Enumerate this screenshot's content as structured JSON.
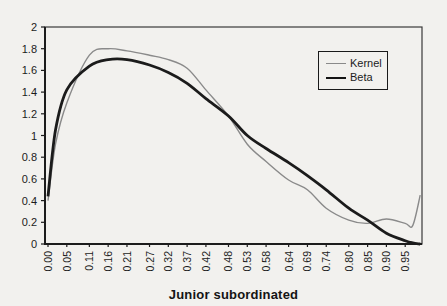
{
  "figure": {
    "background": "#f2f1ee"
  },
  "colors": {
    "kernel_line": "#8a8a8a",
    "beta_line": "#1b1b1b",
    "axis": "#1c1c1c",
    "frame": "#3a3a3a",
    "text": "#1c1c1c"
  },
  "chart_data": {
    "type": "line",
    "title": "",
    "xlabel": "Junior subordinated",
    "ylabel": "",
    "xlim": [
      0,
      1
    ],
    "ylim": [
      0,
      2
    ],
    "grid": false,
    "legend_position": "upper right",
    "y_ticks": [
      0,
      0.2,
      0.4,
      0.6,
      0.8,
      1,
      1.2,
      1.4,
      1.6,
      1.8,
      2
    ],
    "y_tick_labels": [
      "0",
      "0.2",
      "0.4",
      "0.6",
      "0.8",
      "1",
      "1.2",
      "1.4",
      "1.6",
      "1.8",
      "2"
    ],
    "x_ticks": [
      0.0,
      0.05,
      0.11,
      0.16,
      0.21,
      0.27,
      0.32,
      0.37,
      0.42,
      0.48,
      0.53,
      0.58,
      0.64,
      0.69,
      0.74,
      0.8,
      0.85,
      0.9,
      0.95
    ],
    "x_tick_labels": [
      "0.00",
      "0.05",
      "0.11",
      "0.16",
      "0.21",
      "0.27",
      "0.32",
      "0.37",
      "0.42",
      "0.48",
      "0.53",
      "0.58",
      "0.64",
      "0.69",
      "0.74",
      "0.80",
      "0.85",
      "0.90",
      "0.95"
    ],
    "x": [
      0.0,
      0.02,
      0.05,
      0.11,
      0.16,
      0.21,
      0.27,
      0.32,
      0.37,
      0.42,
      0.48,
      0.53,
      0.58,
      0.64,
      0.69,
      0.74,
      0.8,
      0.85,
      0.9,
      0.95,
      0.97,
      0.99
    ],
    "series": [
      {
        "name": "Kernel",
        "style": "thin",
        "color": "#8a8a8a",
        "values": [
          0.4,
          0.92,
          1.3,
          1.74,
          1.8,
          1.78,
          1.74,
          1.7,
          1.62,
          1.42,
          1.18,
          0.92,
          0.76,
          0.59,
          0.5,
          0.33,
          0.22,
          0.19,
          0.23,
          0.19,
          0.17,
          0.45
        ]
      },
      {
        "name": "Beta",
        "style": "thick",
        "color": "#1b1b1b",
        "values": [
          0.44,
          1.05,
          1.42,
          1.64,
          1.7,
          1.7,
          1.65,
          1.58,
          1.48,
          1.34,
          1.18,
          1.0,
          0.88,
          0.75,
          0.63,
          0.5,
          0.33,
          0.22,
          0.1,
          0.03,
          0.01,
          0.0
        ]
      }
    ]
  }
}
